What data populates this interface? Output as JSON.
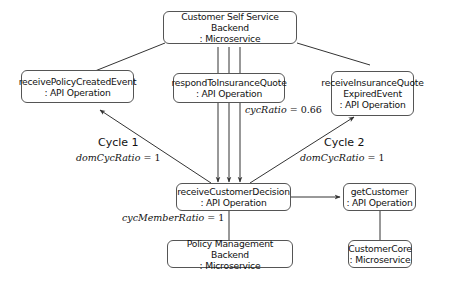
{
  "nodes": {
    "css_backend": {
      "line1": "Customer Self Service Backend",
      "line2": ": Microservice"
    },
    "receive_policy_created": {
      "line1": "receivePolicyCreatedEvent",
      "line2": ": API Operation"
    },
    "respond_to_quote": {
      "line1": "respondToInsuranceQuote",
      "line2": ": API Operation"
    },
    "receive_quote_expired": {
      "line1": "receiveInsuranceQuote",
      "line2": "ExpiredEvent",
      "line3": ": API Operation"
    },
    "receive_customer_decision": {
      "line1": "receiveCustomerDecision",
      "line2": ": API Operation"
    },
    "get_customer": {
      "line1": "getCustomer",
      "line2": ": API Operation"
    },
    "policy_mgmt_backend": {
      "line1": "Policy Management Backend",
      "line2": ": Microservice"
    },
    "customer_core": {
      "line1": "CustomerCore",
      "line2": ": Microservice"
    }
  },
  "labels": {
    "cycle1": {
      "title": "Cycle 1",
      "metric": "domCycRatio",
      "eq": " = ",
      "value": "1"
    },
    "cycle2": {
      "title": "Cycle 2",
      "metric": "domCycRatio",
      "eq": " = ",
      "value": "1"
    },
    "cyc_ratio": {
      "metric": "cycRatio",
      "eq": " = ",
      "value": "0.66"
    },
    "cyc_member_ratio": {
      "metric": "cycMemberRatio",
      "eq": " = ",
      "value": "1"
    }
  },
  "colors": {
    "edge": "#333333",
    "node_border": "#555555"
  }
}
